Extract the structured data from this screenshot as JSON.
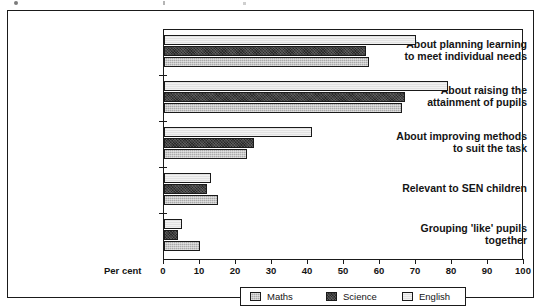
{
  "chart_data": {
    "type": "bar",
    "orientation": "horizontal",
    "title": "",
    "xlabel": "Per cent",
    "ylabel": "",
    "xlim": [
      0,
      100
    ],
    "xticks": [
      0,
      10,
      20,
      30,
      40,
      50,
      60,
      70,
      80,
      90,
      100
    ],
    "grid": false,
    "legend_position": "bottom",
    "categories": [
      "About planning learning to meet individual needs",
      "About raising the attainment of pupils",
      "About improving methods to suit the task",
      "Relevant to SEN children",
      "Grouping 'like' pupils together"
    ],
    "category_lines": [
      [
        "About planning learning",
        "to meet individual needs"
      ],
      [
        "About raising the",
        "attainment of pupils"
      ],
      [
        "About improving methods",
        "to suit the task"
      ],
      [
        "Relevant to SEN children"
      ],
      [
        "Grouping 'like' pupils",
        "together"
      ]
    ],
    "series": [
      {
        "name": "English",
        "key": "english",
        "color": "#e2e2e2",
        "values": [
          70,
          79,
          41,
          13,
          5
        ]
      },
      {
        "name": "Science",
        "key": "science",
        "color": "#2a2a2a",
        "values": [
          56,
          67,
          25,
          12,
          4
        ]
      },
      {
        "name": "Maths",
        "key": "maths",
        "color": "#a9a9a9",
        "values": [
          57,
          66,
          23,
          15,
          10
        ]
      }
    ]
  },
  "axis": {
    "percent_label": "Per cent",
    "tick_labels": [
      "0",
      "10",
      "20",
      "30",
      "40",
      "50",
      "60",
      "70",
      "80",
      "90",
      "100"
    ]
  },
  "legend": {
    "items": [
      {
        "label": "Maths",
        "key": "maths"
      },
      {
        "label": "Science",
        "key": "science"
      },
      {
        "label": "English",
        "key": "english"
      }
    ]
  }
}
